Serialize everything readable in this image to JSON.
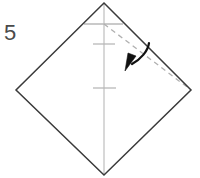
{
  "figure": {
    "step_number": "5",
    "background_color": "#ffffff",
    "canvas": {
      "width": 200,
      "height": 178
    }
  },
  "colors": {
    "outline": "#3a3a3a",
    "crease_light": "#b8b8b8",
    "dashed_fold": "#b0b0b0",
    "arrow": "#111111",
    "label": "#4a4a4a"
  },
  "shapes": {
    "square_sheet": {
      "name": "square-sheet-rotated-45",
      "points": "104,3 191,90 104,175 16,90",
      "stroke": "#3a3a3a",
      "stroke_width": 1.4,
      "fill": "none"
    },
    "center_crease": {
      "name": "vertical-center-crease",
      "x1": 104,
      "y1": 3,
      "x2": 104,
      "y2": 175,
      "stroke": "#b8b8b8",
      "stroke_width": 1.1
    },
    "tick_creases": [
      {
        "name": "crease-tick-top",
        "x1": 84,
        "y1": 24,
        "x2": 123,
        "y2": 24,
        "stroke": "#b8b8b8",
        "stroke_width": 1.2
      },
      {
        "name": "crease-tick-middle",
        "x1": 93,
        "y1": 44,
        "x2": 115,
        "y2": 44,
        "stroke": "#b8b8b8",
        "stroke_width": 1.2
      },
      {
        "name": "crease-tick-lower",
        "x1": 93,
        "y1": 88,
        "x2": 116,
        "y2": 88,
        "stroke": "#b8b8b8",
        "stroke_width": 1.2
      }
    ],
    "dashed_fold_line": {
      "name": "dashed-fold-line",
      "x1": 104,
      "y1": 24,
      "x2": 191,
      "y2": 90,
      "stroke": "#b0b0b0",
      "stroke_width": 1.2,
      "dash_pattern": "5,4"
    },
    "fold_arrow": {
      "name": "curved-fold-arrow",
      "path": "M148,44 C146,52 138,60 129,65",
      "head_path": "M133,58 L124,71 L126,55 Z",
      "stroke": "#111111",
      "stroke_width": 2.1
    }
  }
}
